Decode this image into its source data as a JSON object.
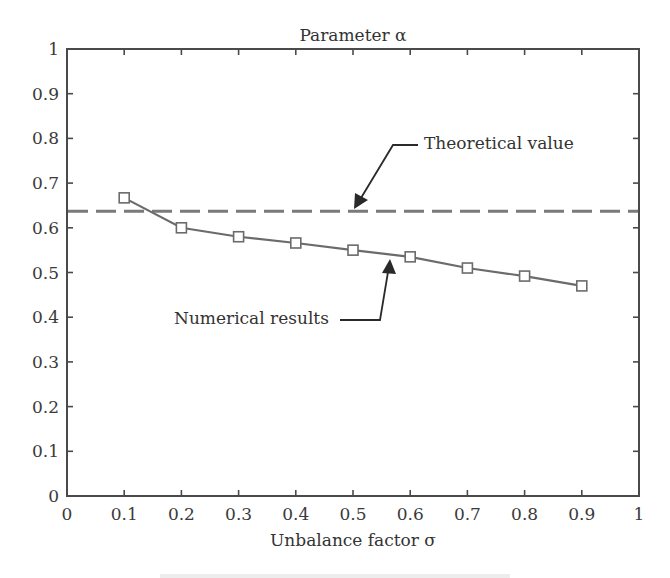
{
  "chart_data": {
    "type": "line",
    "title": "Parameter α",
    "xlabel": "Unbalance factor σ",
    "ylabel": "",
    "xlim": [
      0,
      1
    ],
    "ylim": [
      0,
      1
    ],
    "xticks": [
      "0",
      "0.1",
      "0.2",
      "0.3",
      "0.4",
      "0.5",
      "0.6",
      "0.7",
      "0.8",
      "0.9",
      "1"
    ],
    "yticks": [
      "0",
      "0.1",
      "0.2",
      "0.3",
      "0.4",
      "0.5",
      "0.6",
      "0.7",
      "0.8",
      "0.9",
      "1"
    ],
    "grid": false,
    "legend": "none (inline annotations with arrows)",
    "x": [
      0.1,
      0.2,
      0.3,
      0.4,
      0.5,
      0.6,
      0.7,
      0.8,
      0.9
    ],
    "series": [
      {
        "name": "Numerical results",
        "style": "solid line with square markers",
        "color": "#6b6b6b",
        "values": [
          0.667,
          0.6,
          0.58,
          0.566,
          0.55,
          0.535,
          0.51,
          0.492,
          0.47
        ]
      },
      {
        "name": "Theoretical value",
        "style": "dashed horizontal line",
        "color": "#7a7a7a",
        "constant": 0.637
      }
    ],
    "annotations": [
      {
        "text": "Theoretical value",
        "points_to": "dashed line near σ≈0.5"
      },
      {
        "text": "Numerical results",
        "points_to": "solid curve near σ≈0.57"
      }
    ]
  },
  "colors": {
    "axis": "#4a4a4a",
    "text": "#333333",
    "numerical_line": "#6b6b6b",
    "theoretical_line": "#7a7a7a",
    "arrow": "#2a2a2a"
  }
}
